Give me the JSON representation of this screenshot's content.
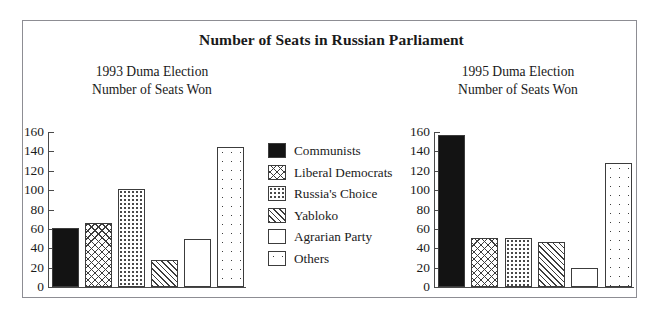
{
  "figure": {
    "title": "Number of Seats in Russian Parliament"
  },
  "legend": {
    "items": [
      {
        "label": "Communists",
        "pattern": "solid"
      },
      {
        "label": "Liberal Democrats",
        "pattern": "crosshatch"
      },
      {
        "label": "Russia's Choice",
        "pattern": "dots-fine"
      },
      {
        "label": "Yabloko",
        "pattern": "diagonal"
      },
      {
        "label": "Agrarian Party",
        "pattern": "empty"
      },
      {
        "label": "Others",
        "pattern": "dots-sparse"
      }
    ]
  },
  "panels": {
    "left": {
      "title_line1": "1993 Duma Election",
      "title_line2": "Number of Seats Won"
    },
    "right": {
      "title_line1": "1995 Duma Election",
      "title_line2": "Number of Seats Won"
    }
  },
  "chart_data": [
    {
      "type": "bar",
      "title": "1993 Duma Election Number of Seats Won",
      "xlabel": "",
      "ylabel": "",
      "ylim": [
        0,
        160
      ],
      "yticks": [
        0,
        20,
        40,
        60,
        80,
        100,
        120,
        140,
        160
      ],
      "grid": false,
      "legend_position": "center",
      "categories": [
        "Communists",
        "Liberal Democrats",
        "Russia's Choice",
        "Yabloko",
        "Agrarian Party",
        "Others"
      ],
      "values": [
        61,
        66,
        101,
        28,
        50,
        145
      ]
    },
    {
      "type": "bar",
      "title": "1995 Duma Election Number of Seats Won",
      "xlabel": "",
      "ylabel": "",
      "ylim": [
        0,
        160
      ],
      "yticks": [
        0,
        20,
        40,
        60,
        80,
        100,
        120,
        140,
        160
      ],
      "grid": false,
      "legend_position": "center",
      "categories": [
        "Communists",
        "Liberal Democrats",
        "Russia's Choice",
        "Yabloko",
        "Agrarian Party",
        "Others"
      ],
      "values": [
        157,
        51,
        51,
        46,
        20,
        128
      ]
    }
  ]
}
